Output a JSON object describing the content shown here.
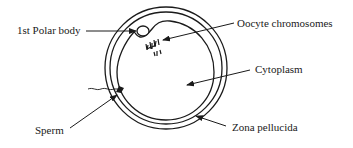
{
  "diagram": {
    "type": "labeled-anatomy",
    "colors": {
      "ink": "#1a1a1a",
      "background": "#ffffff"
    },
    "labels": {
      "polar_body": "1st Polar body",
      "oocyte_chromosomes": "Oocyte chromosomes",
      "cytoplasm": "Cytoplasm",
      "sperm": "Sperm",
      "zona_pellucida": "Zona pellucida"
    }
  }
}
